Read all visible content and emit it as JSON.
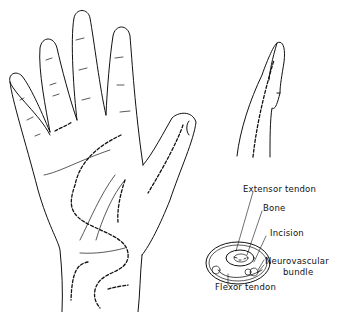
{
  "diagram": {
    "labels": {
      "extensor_tendon": "Extensor tendon",
      "bone": "Bone",
      "incision": "Incision",
      "neurovascular_1": "Neurovascular",
      "neurovascular_2": "bundle",
      "flexor_tendon": "Flexor tendon"
    },
    "colors": {
      "ink": "#111111",
      "background": "#ffffff"
    }
  }
}
